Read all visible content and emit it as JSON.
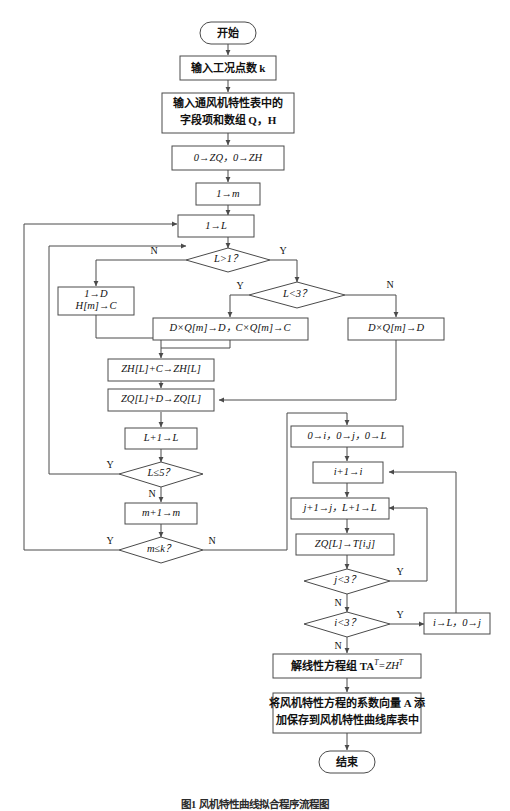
{
  "figure": {
    "caption": "图1 风机特性曲线拟合程序流程图",
    "line_color": "#4a4a4a",
    "fill_color": "#ffffff",
    "text_color": "#111111"
  },
  "nodes": {
    "start": {
      "label": "开始",
      "shape": "terminator"
    },
    "input_k": {
      "label": "输入工况点数 k",
      "shape": "process"
    },
    "input_table_l1": {
      "label": "输入通风机特性表中的",
      "shape": "process"
    },
    "input_table_l2": {
      "label": "字段项和数组 Q，H",
      "shape": "process"
    },
    "init_zq_zh": {
      "label": "0→ZQ，0→ZH",
      "shape": "process"
    },
    "m_init": {
      "label": "1→m",
      "shape": "process"
    },
    "l_init": {
      "label": "1→L",
      "shape": "process"
    },
    "dec_l_gt_1": {
      "label": "L>1？",
      "shape": "decision"
    },
    "dec_l_lt_3": {
      "label": "L<3？",
      "shape": "decision"
    },
    "set_d_c_l1": {
      "label": "1→D",
      "shape": "process"
    },
    "set_d_c_l2": {
      "label": "H[m]→C",
      "shape": "process"
    },
    "mul_dc": {
      "label": "D×Q[m]→D，C×Q[m]→C",
      "shape": "process"
    },
    "mul_d": {
      "label": "D×Q[m]→D",
      "shape": "process"
    },
    "acc_zh": {
      "label": "ZH[L]+C→ZH[L]",
      "shape": "process"
    },
    "acc_zq": {
      "label": "ZQ[L]+D→ZQ[L]",
      "shape": "process"
    },
    "inc_l": {
      "label": "L+1→L",
      "shape": "process"
    },
    "dec_l_le_5": {
      "label": "L≤5？",
      "shape": "decision"
    },
    "inc_m": {
      "label": "m+1→m",
      "shape": "process"
    },
    "dec_m_le_k": {
      "label": "m≤k？",
      "shape": "decision"
    },
    "init_ijl": {
      "label": "0→i，0→j，0→L",
      "shape": "process"
    },
    "inc_i": {
      "label": "i+1→i",
      "shape": "process"
    },
    "inc_jl": {
      "label": "j+1→j，L+1→L",
      "shape": "process"
    },
    "assign_t": {
      "label": "ZQ[L]→T[i,j]",
      "shape": "process"
    },
    "dec_j_lt_3": {
      "label": "j<3？",
      "shape": "decision"
    },
    "dec_i_lt_3": {
      "label": "i<3？",
      "shape": "decision"
    },
    "reset_il": {
      "label": "i→L，0→j",
      "shape": "process"
    },
    "solve_l1": {
      "label": "解线性方程组 TA",
      "label_sup": "T",
      "label_mid": "=ZH",
      "label_sup2": "T",
      "shape": "process"
    },
    "save_l1": {
      "label": "将风机特性方程的系数向量 A 添",
      "shape": "process"
    },
    "save_l2": {
      "label": "加保存到风机特性曲线库表中",
      "shape": "process"
    },
    "end": {
      "label": "结束",
      "shape": "terminator"
    }
  },
  "branch_labels": {
    "l_gt_1_no": "N",
    "l_gt_1_yes": "Y",
    "l_lt_3_yes": "Y",
    "l_lt_3_no": "N",
    "l_le_5_yes": "Y",
    "l_le_5_no": "N",
    "m_le_k_yes": "Y",
    "m_le_k_no": "N",
    "j_lt_3_yes": "Y",
    "j_lt_3_no": "N",
    "i_lt_3_yes": "Y",
    "i_lt_3_no": "N"
  }
}
